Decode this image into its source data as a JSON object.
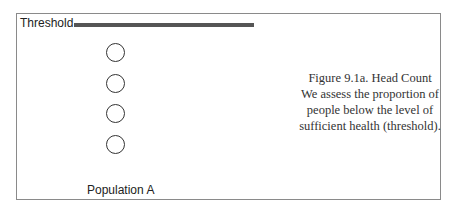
{
  "diagram": {
    "threshold_label": "Threshold",
    "population_label": "Population A",
    "people_count": 4,
    "caption": {
      "title": "Figure 9.1a. Head Count",
      "lines": [
        "We assess the proportion of",
        "people below the level of",
        "sufficient health (threshold)."
      ]
    }
  }
}
